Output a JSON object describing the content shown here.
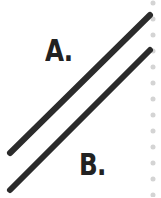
{
  "labels": {
    "a": "A.",
    "b": "B."
  },
  "lines": [
    {
      "name": "line-a",
      "x1": 10,
      "y1": 153,
      "x2": 150,
      "y2": 15
    },
    {
      "name": "line-b",
      "x1": 10,
      "y1": 190,
      "x2": 150,
      "y2": 50
    }
  ],
  "colors": {
    "line": "#2b2b2b",
    "label": "#222222",
    "dots": "#d4d4d4"
  },
  "dots": {
    "x": 153,
    "count": 13,
    "start_y": 3,
    "spacing": 16
  }
}
